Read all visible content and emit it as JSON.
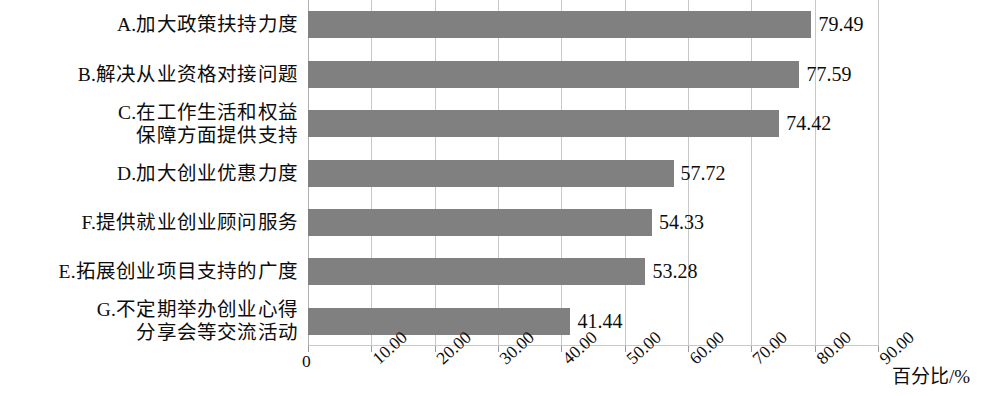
{
  "chart_data": {
    "type": "bar",
    "orientation": "horizontal",
    "title": "",
    "xlabel": "百分比/%",
    "ylabel": "",
    "xlim": [
      0,
      90
    ],
    "grid": true,
    "legend": false,
    "bar_color": "#808080",
    "categories": [
      "A.加大政策扶持力度",
      "B.解决从业资格对接问题",
      "C.在工作生活和权益\n保障方面提供支持",
      "D.加大创业优惠力度",
      "F.提供就业创业顾问服务",
      "E.拓展创业项目支持的广度",
      "G.不定期举办创业心得\n分享会等交流活动"
    ],
    "values": [
      79.49,
      77.59,
      74.42,
      57.72,
      54.33,
      53.28,
      41.44
    ],
    "value_labels": [
      "79.49",
      "77.59",
      "74.42",
      "57.72",
      "54.33",
      "53.28",
      "41.44"
    ],
    "xticks": [
      0,
      10,
      20,
      30,
      40,
      50,
      60,
      70,
      80,
      90
    ],
    "xtick_labels": [
      "0",
      "10.00",
      "20.00",
      "30.00",
      "40.00",
      "50.00",
      "60.00",
      "70.00",
      "80.00",
      "90.00"
    ]
  }
}
